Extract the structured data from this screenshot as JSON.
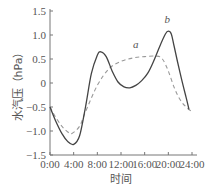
{
  "chart_data": {
    "type": "line",
    "title": "",
    "xlabel": "时间",
    "ylabel": "水汽压（hPa）",
    "x_ticks": [
      "0:00",
      "4:00",
      "8:00",
      "12:00",
      "16:00",
      "20:00",
      "24:00"
    ],
    "y_ticks": [
      "1.5",
      "1.0",
      "0.5",
      "0",
      "-0.5",
      "-1.0",
      "-1.5"
    ],
    "xlim": [
      0,
      24
    ],
    "ylim": [
      -1.5,
      1.5
    ],
    "grid": false,
    "legend": "inline labels",
    "series": [
      {
        "name": "a",
        "style": "dashed",
        "x": [
          0,
          1,
          2,
          3,
          3.7,
          5,
          6,
          8,
          10,
          12,
          14,
          16,
          18,
          19,
          20,
          21,
          22,
          23,
          24
        ],
        "values": [
          -0.5,
          -0.72,
          -0.9,
          -1.02,
          -1.05,
          -0.9,
          -0.6,
          -0.05,
          0.3,
          0.45,
          0.52,
          0.55,
          0.56,
          0.5,
          0.25,
          -0.1,
          -0.35,
          -0.5,
          -0.6
        ]
      },
      {
        "name": "b",
        "style": "solid",
        "x": [
          0,
          1,
          2,
          3,
          4,
          5,
          6,
          7,
          8,
          8.6,
          9.5,
          10.5,
          11.5,
          12.5,
          13.5,
          14.5,
          15.5,
          16.5,
          17.5,
          18.5,
          19.5,
          20,
          20.5,
          21,
          22,
          23,
          23.5
        ],
        "values": [
          -0.5,
          -0.8,
          -1.05,
          -1.22,
          -1.28,
          -1.1,
          -0.5,
          0.2,
          0.58,
          0.65,
          0.55,
          0.25,
          0.02,
          -0.08,
          -0.1,
          -0.05,
          0.05,
          0.2,
          0.45,
          0.75,
          1.02,
          1.08,
          1.02,
          0.75,
          0.2,
          -0.3,
          -0.55
        ]
      }
    ],
    "annotations": [
      {
        "text": "a",
        "x": 14.5,
        "y": 0.72
      },
      {
        "text": "b",
        "x": 19.8,
        "y": 1.25
      }
    ]
  }
}
